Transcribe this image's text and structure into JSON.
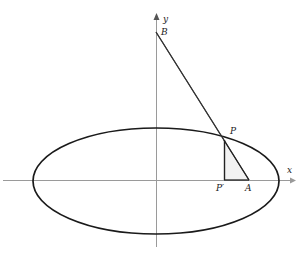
{
  "figure": {
    "background_color": "#ffffff",
    "width": 300,
    "height": 257
  },
  "colors": {
    "axis": "#9a9a9a",
    "curve": "#1a1a1a",
    "line": "#333333",
    "shade_fill": "#f2f2f2",
    "label": "#1a1a1a"
  },
  "axes": {
    "origin": {
      "x": 156,
      "y": 180
    },
    "x_axis": {
      "label": "x",
      "from": {
        "x": 3,
        "y": 180
      },
      "to": {
        "x": 292,
        "y": 180
      },
      "arrow": true
    },
    "y_axis": {
      "label": "y",
      "from": {
        "x": 156,
        "y": 247
      },
      "to": {
        "x": 156,
        "y": 18
      },
      "arrow": true
    }
  },
  "ellipse": {
    "center": {
      "x": 156,
      "y": 181
    },
    "semi_major_x": 123,
    "semi_minor_y": 53,
    "stroke_width": 1.6
  },
  "points": [
    {
      "name": "B",
      "label": "B",
      "x": 156,
      "y": 32,
      "on": "y-axis"
    },
    {
      "name": "P",
      "label": "P",
      "x": 224,
      "y": 140,
      "on": "ellipse"
    },
    {
      "name": "P-prime",
      "label": "P′",
      "x": 224,
      "y": 180,
      "on": "x-axis"
    },
    {
      "name": "A",
      "label": "A",
      "x": 249,
      "y": 180,
      "on": "x-axis"
    }
  ],
  "segments": [
    {
      "name": "B-to-A",
      "from": "B",
      "to": "A"
    },
    {
      "name": "B-to-P",
      "from": "B",
      "to": "P"
    },
    {
      "name": "P-to-A",
      "from": "P",
      "to": "A"
    },
    {
      "name": "P-to-P-prime",
      "from": "P",
      "to": "P-prime"
    },
    {
      "name": "P-prime-to-A",
      "from": "P-prime",
      "to": "A"
    }
  ],
  "shaded_region": {
    "name": "triangle-P-Pprime-A",
    "vertices": [
      "P",
      "P-prime",
      "A"
    ],
    "fill": "#f2f2f2"
  },
  "labels": {
    "y_axis": "y",
    "x_axis": "x",
    "point_B": "B",
    "point_P": "P",
    "point_P_prime": "P′",
    "point_A": "A"
  }
}
